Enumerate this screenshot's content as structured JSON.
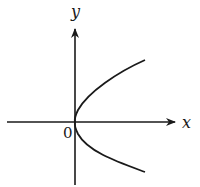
{
  "diagram": {
    "type": "coordinate-plot",
    "labels": {
      "x_axis": "x",
      "y_axis": "y",
      "origin": "0"
    },
    "curve": {
      "shape": "parabola",
      "opens": "right",
      "vertex": [
        0,
        0
      ]
    },
    "colors": {
      "stroke": "#1a1a1a",
      "background": "#ffffff"
    }
  }
}
